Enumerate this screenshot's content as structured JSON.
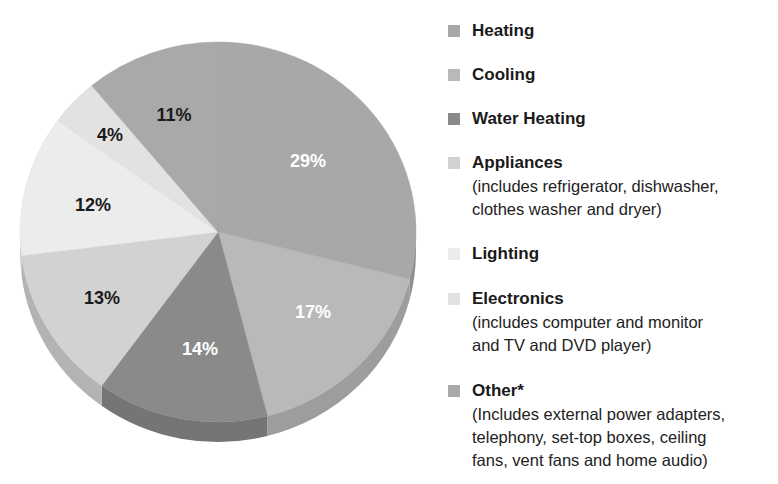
{
  "chart_data": {
    "type": "pie",
    "title": "",
    "style": "3d-pie",
    "legend_position": "right",
    "categories": [
      "Heating",
      "Cooling",
      "Water Heating",
      "Appliances",
      "Lighting",
      "Electronics",
      "Other*"
    ],
    "values": [
      29,
      17,
      14,
      13,
      12,
      4,
      11
    ],
    "value_labels": [
      "29%",
      "17%",
      "14%",
      "13%",
      "12%",
      "4%",
      "11%"
    ],
    "colors": [
      "#a8a8a8",
      "#b9b9b9",
      "#8a8a8a",
      "#d2d2d2",
      "#ececec",
      "#e2e2e2",
      "#a9a9a9"
    ],
    "label_colors": [
      "#ffffff",
      "#ffffff",
      "#ffffff",
      "#1a1a1a",
      "#1a1a1a",
      "#1a1a1a",
      "#1a1a1a"
    ]
  },
  "legend": {
    "items": [
      {
        "title": "Heating",
        "desc": "",
        "color": "#a8a8a8"
      },
      {
        "title": "Cooling",
        "desc": "",
        "color": "#b9b9b9"
      },
      {
        "title": "Water Heating",
        "desc": "",
        "color": "#8a8a8a"
      },
      {
        "title": "Appliances",
        "desc": "(includes refrigerator, dishwasher,\nclothes washer and dryer)",
        "color": "#d2d2d2"
      },
      {
        "title": "Lighting",
        "desc": "",
        "color": "#ececec"
      },
      {
        "title": "Electronics",
        "desc": "(includes computer and monitor\nand TV and DVD player)",
        "color": "#e2e2e2"
      },
      {
        "title": "Other*",
        "desc": "(Includes external power adapters,\ntelephony, set-top boxes, ceiling\nfans, vent fans and home audio)",
        "color": "#a9a9a9"
      }
    ]
  }
}
